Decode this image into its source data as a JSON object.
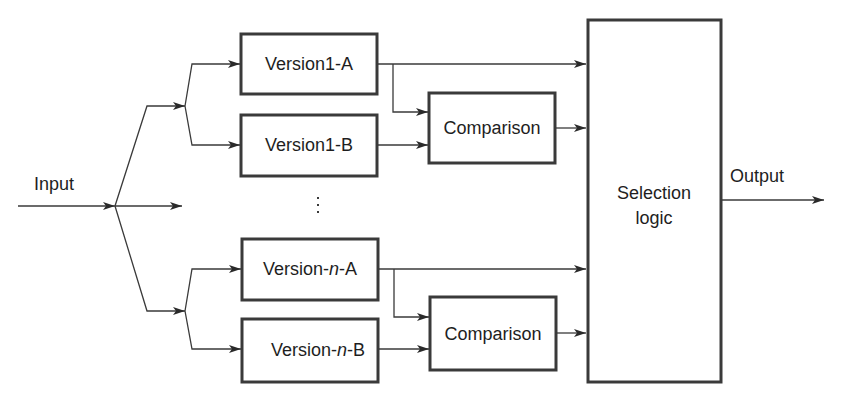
{
  "diagram": {
    "input_label": "Input",
    "output_label": "Output",
    "blocks": {
      "v1a": "Version1-A",
      "v1b": "Version1-B",
      "vna_pre": "Version-",
      "vna_n": "n",
      "vna_post": "-A",
      "vnb_pre": "Version-",
      "vnb_n": "n",
      "vnb_post": "-B",
      "cmp1": "Comparison",
      "cmp2": "Comparison",
      "sel_line1": "Selection",
      "sel_line2": "logic"
    },
    "ellipsis": "vertical-ellipsis",
    "colors": {
      "stroke": "#3a3a3a",
      "text": "#1e1e1e",
      "background": "#ffffff"
    }
  }
}
